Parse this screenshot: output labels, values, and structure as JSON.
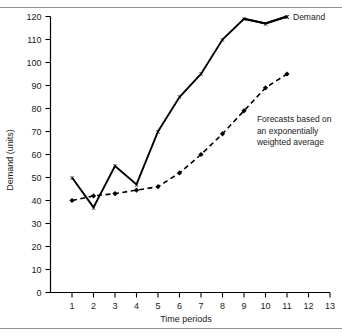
{
  "chart_data": {
    "type": "line",
    "title": "",
    "xlabel": "Time periods",
    "ylabel": "Demand (units)",
    "x": [
      1,
      2,
      3,
      4,
      5,
      6,
      7,
      8,
      9,
      10,
      11
    ],
    "xlim": [
      0,
      13
    ],
    "ylim": [
      0,
      120
    ],
    "xticks": [
      "1",
      "2",
      "3",
      "4",
      "5",
      "6",
      "7",
      "8",
      "9",
      "10",
      "11",
      "12",
      "13"
    ],
    "xtick_values": [
      1,
      2,
      3,
      4,
      5,
      6,
      7,
      8,
      9,
      10,
      11,
      12,
      13
    ],
    "yticks": [
      "0",
      "10",
      "20",
      "30",
      "40",
      "50",
      "60",
      "70",
      "80",
      "90",
      "100",
      "110",
      "120"
    ],
    "ytick_values": [
      0,
      10,
      20,
      30,
      40,
      50,
      60,
      70,
      80,
      90,
      100,
      110,
      120
    ],
    "grid": false,
    "legend_position": "top-right",
    "series": [
      {
        "name": "Demand",
        "marker": "x",
        "linestyle": "solid",
        "color": "#000000",
        "values": [
          50,
          37,
          55,
          47,
          70,
          85,
          95,
          110,
          119,
          117,
          120
        ]
      },
      {
        "name": "Forecasts based on an exponentially weighted average",
        "marker": "filled-diamond",
        "linestyle": "dashed",
        "color": "#000000",
        "values": [
          40,
          42,
          43,
          44.5,
          46,
          52,
          60,
          69,
          79,
          89,
          95
        ]
      }
    ],
    "annotations": [
      {
        "name": "forecast-annotation",
        "lines": [
          "Forecasts based on",
          "an exponentially",
          "weighted average"
        ],
        "x": 9.6,
        "y": 74
      }
    ],
    "legend_entries": [
      {
        "marker": "x",
        "label": "Demand"
      }
    ]
  },
  "legend": {
    "demand_marker": "x",
    "demand_label": "Demand"
  },
  "annotation": {
    "line1": "Forecasts based on",
    "line2": "an exponentially",
    "line3": "weighted average"
  },
  "axes": {
    "x_title": "Time periods",
    "y_title": "Demand (units)"
  },
  "colors": {
    "ink": "#000000",
    "rule": "#8d8d8d",
    "background": "#ffffff"
  }
}
